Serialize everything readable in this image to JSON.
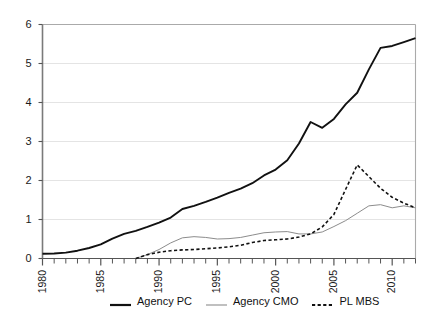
{
  "chart_data": {
    "type": "line",
    "title": "",
    "xlabel": "",
    "ylabel": "",
    "xlim": [
      1980,
      2012
    ],
    "ylim": [
      0,
      6
    ],
    "grid": true,
    "grid_axis": "y",
    "legend_position": "bottom",
    "yticks": [
      0,
      1,
      2,
      3,
      4,
      5,
      6
    ],
    "ytick_labels": [
      "0",
      "1",
      "2",
      "3",
      "4",
      "5",
      "6"
    ],
    "xticks": [
      1980,
      1985,
      1990,
      1995,
      2000,
      2005,
      2010
    ],
    "xtick_labels": [
      "1980",
      "1985",
      "1990",
      "1995",
      "2000",
      "2005",
      "2010"
    ],
    "x_minor_tick_interval": 1,
    "x": [
      1980,
      1981,
      1982,
      1983,
      1984,
      1985,
      1986,
      1987,
      1988,
      1989,
      1990,
      1991,
      1992,
      1993,
      1994,
      1995,
      1996,
      1997,
      1998,
      1999,
      2000,
      2001,
      2002,
      2003,
      2004,
      2005,
      2006,
      2007,
      2008,
      2009,
      2010,
      2011,
      2012
    ],
    "series": [
      {
        "name": "Agency PC",
        "style": "solid",
        "color": "#111111",
        "width": 1.9,
        "values": [
          0.12,
          0.13,
          0.15,
          0.2,
          0.27,
          0.36,
          0.51,
          0.63,
          0.71,
          0.81,
          0.92,
          1.05,
          1.27,
          1.35,
          1.45,
          1.56,
          1.68,
          1.79,
          1.93,
          2.13,
          2.28,
          2.52,
          2.95,
          3.5,
          3.35,
          3.58,
          3.95,
          4.25,
          4.85,
          5.4,
          5.45,
          5.55,
          5.65
        ]
      },
      {
        "name": "Agency CMO",
        "style": "solid",
        "color": "#8c8c8c",
        "width": 1.0,
        "values": [
          null,
          null,
          null,
          null,
          null,
          null,
          null,
          null,
          0.0,
          0.1,
          0.23,
          0.4,
          0.53,
          0.56,
          0.54,
          0.5,
          0.51,
          0.54,
          0.6,
          0.66,
          0.68,
          0.69,
          0.63,
          0.63,
          0.68,
          0.82,
          0.97,
          1.16,
          1.35,
          1.38,
          1.3,
          1.35,
          1.3
        ]
      },
      {
        "name": "PL MBS",
        "style": "dashed",
        "color": "#111111",
        "width": 1.6,
        "values": [
          null,
          null,
          null,
          null,
          null,
          null,
          null,
          null,
          0.0,
          0.1,
          0.16,
          0.2,
          0.22,
          0.23,
          0.25,
          0.27,
          0.3,
          0.34,
          0.41,
          0.46,
          0.48,
          0.5,
          0.55,
          0.63,
          0.81,
          1.13,
          1.77,
          2.4,
          2.1,
          1.8,
          1.57,
          1.42,
          1.3
        ]
      }
    ]
  },
  "legend": {
    "items": [
      {
        "label": "Agency PC",
        "style": "solid",
        "color": "#111111",
        "width": 2.2
      },
      {
        "label": "Agency CMO",
        "style": "solid",
        "color": "#8c8c8c",
        "width": 1.1
      },
      {
        "label": "PL MBS",
        "style": "dashed",
        "color": "#111111",
        "width": 1.8
      }
    ]
  }
}
